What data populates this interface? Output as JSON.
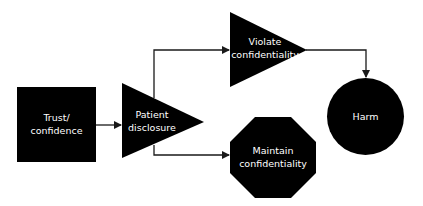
{
  "diagram": {
    "type": "flowchart",
    "colors": {
      "shape_fill": "#000000",
      "text": "#ffffff",
      "connector": "#1a1a1a",
      "background": "#ffffff"
    },
    "nodes": [
      {
        "id": "trust",
        "shape": "square",
        "label_lines": [
          "Trust/",
          "confidence"
        ]
      },
      {
        "id": "disclosure",
        "shape": "triangle",
        "label_lines": [
          "Patient",
          "disclosure"
        ]
      },
      {
        "id": "violate",
        "shape": "triangle",
        "label_lines": [
          "Violate",
          "confidentiality"
        ]
      },
      {
        "id": "maintain",
        "shape": "octagon",
        "label_lines": [
          "Maintain",
          "confidentiality"
        ]
      },
      {
        "id": "harm",
        "shape": "circle",
        "label_lines": [
          "Harm"
        ]
      }
    ],
    "edges": [
      {
        "from": "trust",
        "to": "disclosure"
      },
      {
        "from": "disclosure",
        "to": "violate"
      },
      {
        "from": "disclosure",
        "to": "maintain"
      },
      {
        "from": "violate",
        "to": "harm"
      }
    ]
  }
}
